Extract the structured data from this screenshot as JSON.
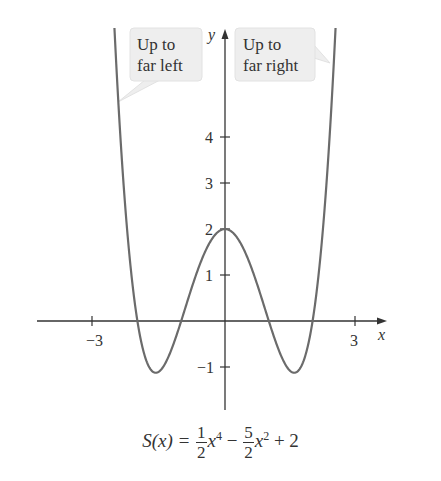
{
  "chart_data": {
    "type": "line",
    "function": "S(x) = 0.5*x^4 - 2.5*x^2 + 2",
    "xlabel": "x",
    "ylabel": "y",
    "x_ticks": [
      -3,
      3
    ],
    "y_ticks": [
      -1,
      1,
      2,
      3,
      4
    ],
    "xlim": [
      -4.3,
      3.6
    ],
    "ylim": [
      -1.9,
      6.3
    ],
    "grid": false,
    "key_points": {
      "roots": [
        -2,
        -1,
        1,
        2
      ],
      "local_max": [
        0,
        2
      ],
      "local_min": [
        [
          -1.58,
          -1.125
        ],
        [
          1.58,
          -1.125
        ]
      ]
    },
    "series": [
      {
        "name": "S(x)",
        "x": [
          -2.6,
          -2.5,
          -2.25,
          -2.0,
          -1.75,
          -1.58,
          -1.5,
          -1.25,
          -1.0,
          -0.75,
          -0.5,
          -0.25,
          0,
          0.25,
          0.5,
          0.75,
          1.0,
          1.25,
          1.5,
          1.58,
          1.75,
          2.0,
          2.25,
          2.5,
          2.6
        ],
        "values": [
          7.94,
          3.91,
          1.84,
          0,
          -0.97,
          -1.125,
          -1.09,
          -0.7,
          0,
          0.75,
          1.41,
          1.85,
          2,
          1.85,
          1.41,
          0.75,
          0,
          -0.7,
          -1.09,
          -1.125,
          -0.97,
          0,
          1.84,
          3.91,
          7.94
        ]
      }
    ],
    "annotations": [
      {
        "text": "Up to far left",
        "points_to": "left branch rising"
      },
      {
        "text": "Up to far right",
        "points_to": "right branch rising"
      }
    ]
  },
  "labels": {
    "x_axis": "x",
    "y_axis": "y",
    "x_tick_labels": [
      "−3",
      "3"
    ],
    "y_tick_labels": [
      "4",
      "3",
      "2",
      "1",
      "−1"
    ]
  },
  "callouts": {
    "left": {
      "line1": "Up to",
      "line2": "far left"
    },
    "right": {
      "line1": "Up to",
      "line2": "far right"
    }
  },
  "formula": {
    "lhs": "S(x) =",
    "frac1_num": "1",
    "frac1_den": "2",
    "term1_var": "x",
    "term1_exp": "4",
    "minus": "−",
    "frac2_num": "5",
    "frac2_den": "2",
    "term2_var": "x",
    "term2_exp": "2",
    "tail": "+ 2"
  },
  "colors": {
    "axis": "#333333",
    "curve": "#6b6b6b",
    "callout_bg": "#eeeeee",
    "callout_border": "#dddddd"
  }
}
